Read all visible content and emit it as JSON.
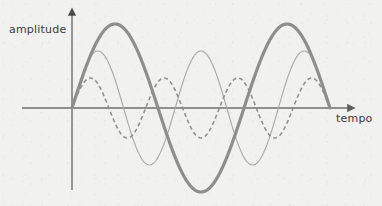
{
  "figure": {
    "background_color": "#f1f1ef",
    "axes": {
      "y_label": "amplitude",
      "x_label": "tempo",
      "axis_color": "#6e6e6e",
      "origin": {
        "x": 72,
        "y": 108
      },
      "x_axis_start": {
        "x": 22,
        "y": 108
      },
      "x_axis_arrow_tip": {
        "x": 352,
        "y": 108
      },
      "y_axis_arrow_tip": {
        "x": 72,
        "y": 10
      },
      "y_axis_bottom": {
        "x": 72,
        "y": 190
      }
    }
  },
  "chart_data": {
    "type": "line",
    "title": "",
    "xlabel": "tempo",
    "ylabel": "amplitude",
    "xlim": [
      0,
      1
    ],
    "ylim": [
      -1,
      1
    ],
    "grid": false,
    "legend": "none",
    "x_domain_px": [
      72,
      330
    ],
    "series": [
      {
        "name": "wave-thick",
        "style": "solid",
        "stroke_width": 3.2,
        "color": "#8e8e8e",
        "amplitude_px": 84,
        "cycles": 1.5,
        "phase": 0,
        "description": "low frequency, large amplitude"
      },
      {
        "name": "wave-thin",
        "style": "solid",
        "stroke_width": 1.1,
        "color": "#a8a8a8",
        "amplitude_px": 57,
        "cycles": 2.5,
        "phase": 0,
        "description": "medium frequency, medium amplitude"
      },
      {
        "name": "wave-dashed",
        "style": "dashed",
        "stroke_width": 1.6,
        "dash_pattern": "4 3",
        "color": "#909090",
        "amplitude_px": 30,
        "cycles": 3.5,
        "phase": 0,
        "description": "high frequency, small amplitude"
      }
    ]
  },
  "labels": {
    "amplitude": "amplitude",
    "tempo": "tempo"
  }
}
